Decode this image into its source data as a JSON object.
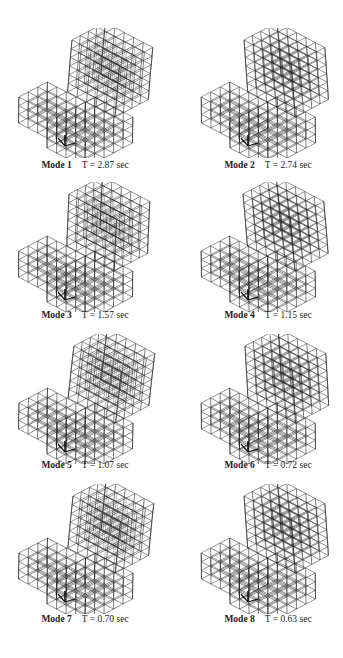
{
  "figure": {
    "panels": [
      {
        "mode": "Mode 1",
        "period": "T = 2.87 sec"
      },
      {
        "mode": "Mode 2",
        "period": "T = 2.74 sec"
      },
      {
        "mode": "Mode 3",
        "period": "T = 1.57 sec"
      },
      {
        "mode": "Mode 4",
        "period": "T = 1.15 sec"
      },
      {
        "mode": "Mode 5",
        "period": "T = 1.07 sec"
      },
      {
        "mode": "Mode 6",
        "period": "T = 0.72 sec"
      },
      {
        "mode": "Mode 7",
        "period": "T = 0.70 sec"
      },
      {
        "mode": "Mode 8",
        "period": "T = 0.63 sec"
      }
    ],
    "axis_labels": {
      "x": "x",
      "y": "y",
      "z": "z"
    },
    "colors": {
      "line": "#2a2a2a",
      "background": "#ffffff",
      "text": "#222222"
    }
  }
}
